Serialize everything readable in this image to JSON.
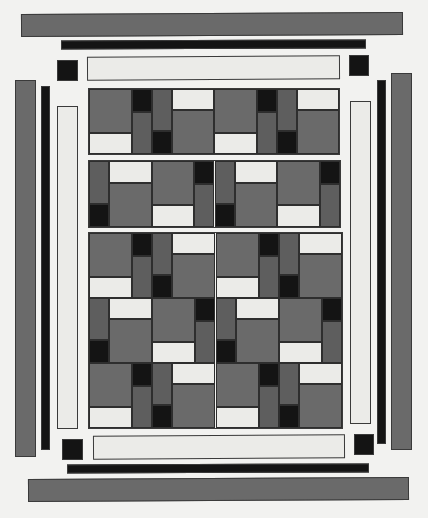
{
  "artwork": {
    "type": "quilt-pattern",
    "colors": {
      "gray": "#6a6a6a",
      "dark_gray": "#5e5e5e",
      "black": "#141414",
      "cream": "#ebebe8",
      "background": "#f2f2f0",
      "outline": "#3a3a3a"
    },
    "border": {
      "outer_bars": [
        "top-gray",
        "bottom-gray",
        "left-gray",
        "right-gray"
      ],
      "inner_bars": [
        "top-black",
        "bottom-black",
        "left-black",
        "right-black"
      ],
      "sashing_strips": [
        "top-cream",
        "bottom-cream",
        "left-cream",
        "right-cream"
      ],
      "corner_squares": [
        "top-left",
        "top-right",
        "bottom-left",
        "bottom-right"
      ]
    },
    "panels": [
      {
        "name": "panel-1",
        "rows": 1,
        "row_patterns": [
          "ABAB"
        ]
      },
      {
        "name": "panel-2",
        "rows": 1,
        "row_patterns": [
          "BABA"
        ]
      },
      {
        "name": "panel-3",
        "rows": 3,
        "row_patterns": [
          "ABAB",
          "BABA",
          "ABAB"
        ]
      }
    ]
  }
}
